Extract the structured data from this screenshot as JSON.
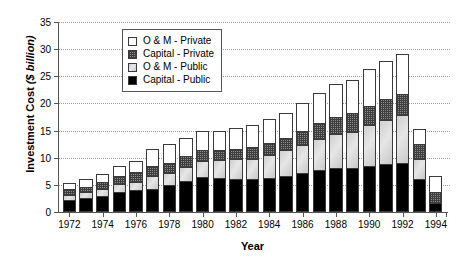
{
  "chart_data": {
    "type": "bar",
    "stacked": true,
    "title": "",
    "xlabel": "Year",
    "ylabel": "Investment Cost ($ billion)",
    "ylabel_plain": "Investment Cost ",
    "ylabel_italic": "($ billion)",
    "ylim": [
      0,
      35
    ],
    "yticks": [
      0,
      5,
      10,
      15,
      20,
      25,
      30,
      35
    ],
    "grid": "horizontal-dotted",
    "legend_position": "top-center",
    "categories": [
      1972,
      1973,
      1974,
      1975,
      1976,
      1977,
      1978,
      1979,
      1980,
      1981,
      1982,
      1983,
      1984,
      1985,
      1986,
      1987,
      1988,
      1989,
      1990,
      1991,
      1992,
      1993,
      1994
    ],
    "xtick_labels": [
      "1972",
      "1974",
      "1976",
      "1978",
      "1980",
      "1982",
      "1984",
      "1986",
      "1988",
      "1990",
      "1992",
      "1994"
    ],
    "xtick_years": [
      1972,
      1974,
      1976,
      1978,
      1980,
      1982,
      1984,
      1986,
      1988,
      1990,
      1992,
      1994
    ],
    "series": [
      {
        "name": "Capital - Public",
        "key": "capital-public",
        "color": "#000000",
        "pattern": "solid-black",
        "values": [
          2.2,
          2.5,
          2.9,
          3.7,
          4.0,
          4.2,
          4.9,
          5.8,
          6.5,
          6.3,
          6.1,
          6.0,
          6.3,
          6.6,
          7.1,
          7.7,
          8.2,
          8.2,
          8.5,
          8.8,
          9.1,
          6.0,
          1.7
        ]
      },
      {
        "name": "O & M - Public",
        "key": "om-public",
        "color": "#d2d2d2",
        "pattern": "light-grey",
        "values": [
          1.0,
          1.1,
          1.3,
          1.4,
          1.6,
          2.4,
          2.3,
          2.5,
          2.9,
          3.2,
          3.6,
          3.8,
          4.2,
          4.8,
          5.3,
          5.7,
          6.1,
          6.6,
          7.5,
          8.1,
          8.7,
          3.8,
          0.0
        ]
      },
      {
        "name": "Capital - Private",
        "key": "capital-private",
        "color": "#8e8e8e",
        "pattern": "dark-checker",
        "values": [
          1.0,
          1.1,
          1.3,
          1.6,
          1.8,
          1.8,
          1.9,
          2.0,
          2.0,
          1.9,
          1.9,
          2.2,
          2.3,
          2.3,
          2.6,
          3.0,
          3.2,
          3.5,
          3.6,
          3.9,
          4.0,
          2.8,
          2.0
        ]
      },
      {
        "name": "O & M - Private",
        "key": "om-private",
        "color": "#ffffff",
        "pattern": "white",
        "values": [
          1.2,
          1.4,
          1.5,
          1.7,
          2.0,
          3.3,
          3.4,
          3.4,
          3.5,
          3.6,
          3.9,
          4.0,
          4.4,
          4.6,
          5.0,
          5.6,
          6.0,
          6.1,
          6.8,
          7.0,
          7.3,
          2.7,
          3.0
        ]
      }
    ],
    "totals": [
      5.4,
      6.1,
      7.0,
      8.4,
      9.4,
      11.7,
      12.5,
      13.7,
      14.9,
      15.0,
      15.5,
      16.0,
      17.2,
      18.3,
      20.0,
      22.0,
      23.5,
      24.4,
      26.4,
      27.8,
      29.1,
      15.3,
      6.7
    ]
  },
  "legend": {
    "items": [
      {
        "label": "O & M - Private",
        "key": "om-private"
      },
      {
        "label": "Capital - Private",
        "key": "capital-private"
      },
      {
        "label": "O & M - Public",
        "key": "om-public"
      },
      {
        "label": "Capital - Public",
        "key": "capital-public"
      }
    ]
  }
}
